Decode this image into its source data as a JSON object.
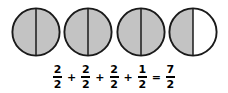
{
  "figure": {
    "background_color": "#ffffff"
  },
  "style": {
    "shaded_fill": "#c3c3c3",
    "unshaded_fill": "#ffffff",
    "outline_color": "#1a1a1a",
    "divider_color": "#1a1a1a",
    "text_color": "#000000"
  },
  "circles": [
    {
      "index": 1,
      "label": "circle-1",
      "parts_total": 2,
      "parts_shaded": 2,
      "left_half_shaded": true,
      "right_half_shaded": true,
      "value": "2/2",
      "x": 11
    },
    {
      "index": 2,
      "label": "circle-2",
      "parts_total": 2,
      "parts_shaded": 2,
      "left_half_shaded": true,
      "right_half_shaded": true,
      "value": "2/2",
      "x": 63
    },
    {
      "index": 3,
      "label": "circle-3",
      "parts_total": 2,
      "parts_shaded": 2,
      "left_half_shaded": true,
      "right_half_shaded": true,
      "value": "2/2",
      "x": 116
    },
    {
      "index": 4,
      "label": "circle-4",
      "parts_total": 2,
      "parts_shaded": 1,
      "left_half_shaded": true,
      "right_half_shaded": false,
      "value": "1/2",
      "x": 168
    }
  ],
  "equation": {
    "full_text": "2/2 + 2/2 + 2/2 + 1/2 = 7/2",
    "terms": [
      {
        "numerator": "2",
        "denominator": "2"
      },
      {
        "numerator": "2",
        "denominator": "2"
      },
      {
        "numerator": "2",
        "denominator": "2"
      },
      {
        "numerator": "1",
        "denominator": "2"
      }
    ],
    "result": {
      "numerator": "7",
      "denominator": "2"
    },
    "plus_sign": "+",
    "equals_sign": "="
  }
}
